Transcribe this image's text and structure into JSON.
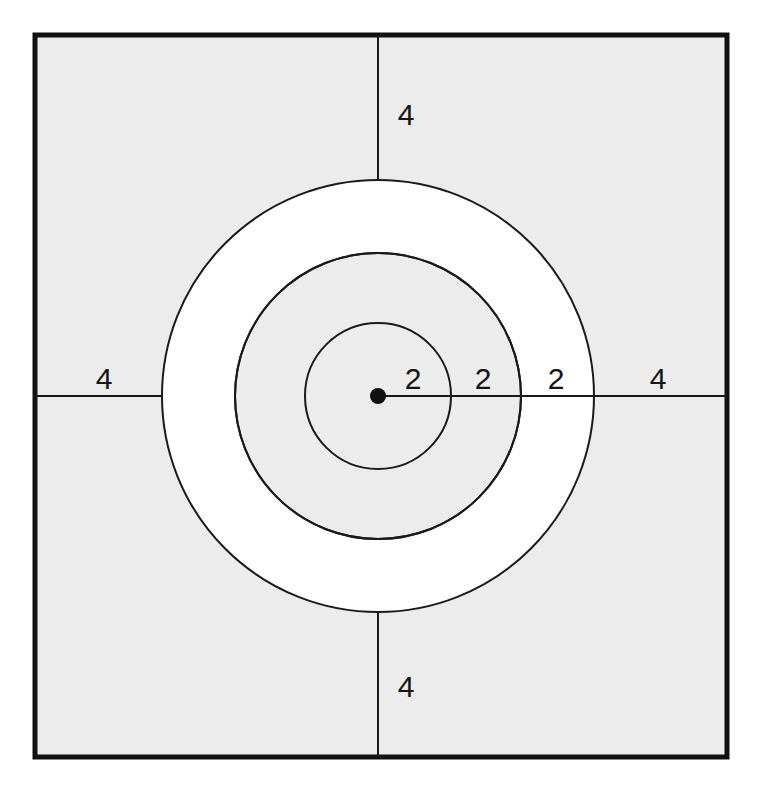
{
  "figure": {
    "background_color": "#ffffff",
    "shaded_color": "#ececec",
    "white_band_color": "#ffffff",
    "stroke_color": "#1a1a1a",
    "border_color": "#111111"
  },
  "square": {
    "name": "outer-square",
    "x": 35,
    "y": 35,
    "width": 692,
    "height": 722,
    "stroke_width": 5,
    "fill": "#ececec"
  },
  "center": {
    "name": "center-point",
    "x": 378,
    "y": 396,
    "dot_radius": 8,
    "fill": "#111111"
  },
  "circles": [
    {
      "name": "inner-circle",
      "radius": 73,
      "fill": "#ececec",
      "stroke_width": 2
    },
    {
      "name": "middle-circle",
      "radius": 143,
      "fill": "#ffffff",
      "stroke_width": 2
    },
    {
      "name": "outer-circle",
      "radius": 216,
      "fill": "#ffffff",
      "stroke_width": 2
    }
  ],
  "axis_lines": {
    "stroke_width": 2,
    "right": {
      "x1": 378,
      "y1": 396,
      "x2": 727,
      "y2": 396
    },
    "left": {
      "x1": 35,
      "y1": 396,
      "x2": 162,
      "y2": 396
    },
    "up": {
      "x1": 378,
      "y1": 35,
      "x2": 378,
      "y2": 180
    },
    "down": {
      "x1": 378,
      "y1": 612,
      "x2": 378,
      "y2": 757
    }
  },
  "labels": [
    {
      "name": "label-radius-inner",
      "text": "2",
      "x": 413,
      "y": 389
    },
    {
      "name": "label-radius-middle",
      "text": "2",
      "x": 483,
      "y": 389
    },
    {
      "name": "label-radius-outer",
      "text": "2",
      "x": 556,
      "y": 389
    },
    {
      "name": "label-top-4",
      "text": "4",
      "x": 406,
      "y": 125
    },
    {
      "name": "label-left-4",
      "text": "4",
      "x": 104,
      "y": 389
    },
    {
      "name": "label-right-4",
      "text": "4",
      "x": 658,
      "y": 389
    },
    {
      "name": "label-bottom-4",
      "text": "4",
      "x": 406,
      "y": 697
    }
  ],
  "chart_data": {
    "type": "diagram",
    "units": "unitless",
    "center_label": "center point",
    "radii_increments": [
      2,
      2,
      2
    ],
    "cumulative_radii": [
      2,
      4,
      6
    ],
    "outer_margins": [
      4,
      4,
      4,
      4
    ],
    "margin_labels": {
      "top": "4",
      "left": "4",
      "right": "4",
      "bottom": "4"
    },
    "radial_segment_labels": [
      "2",
      "2",
      "2"
    ],
    "square_side_total": 20,
    "legend": [],
    "grid": false
  }
}
